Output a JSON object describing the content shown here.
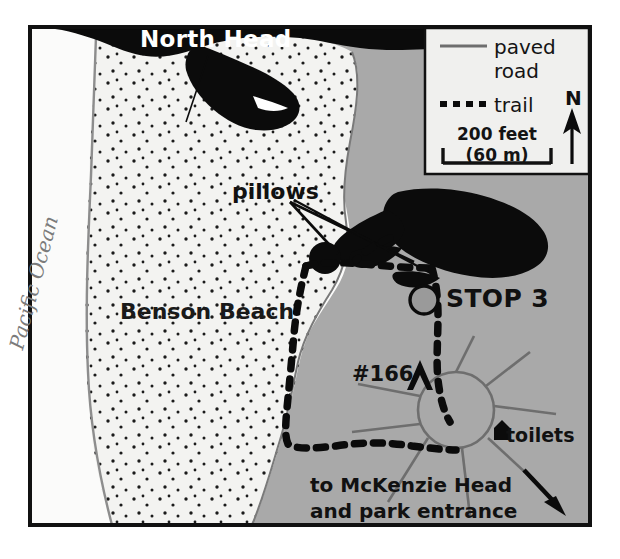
{
  "map": {
    "title_labels": {
      "north_head": "North Head",
      "pacific_ocean": "Pacific Ocean",
      "benson_beach": "Benson Beach",
      "pillows": "pillows",
      "stop3": "STOP 3",
      "site_166": "#166",
      "toilets": "toilets",
      "to_mckenzie": "to McKenzie Head\nand park entrance"
    },
    "legend": {
      "paved_road_label": "paved\nroad",
      "trail_label": "trail",
      "scale_label": "200 feet\n(60 m)",
      "north_label": "N",
      "scale_feet": 200,
      "scale_meters": 60
    },
    "colors": {
      "beach_sand": "#f2f2f0",
      "upland_gray": "#a9a9a9",
      "ocean_white": "#fbfbfa",
      "rock_black": "#0b0b0b",
      "frame_black": "#111111",
      "shoreline_gray": "#8d8d8d",
      "road_gray": "#6e6e6e",
      "stop_marker_fill": "#9a9a9a",
      "label_white": "#ffffff"
    },
    "features": {
      "stop_marker_count": 1,
      "pillow_outcrop_count": 2,
      "leader_line_count": 2,
      "parking_loop": "circular road loop",
      "radiating_roads": 7,
      "direction_arrow": "down-right to park entrance"
    }
  }
}
